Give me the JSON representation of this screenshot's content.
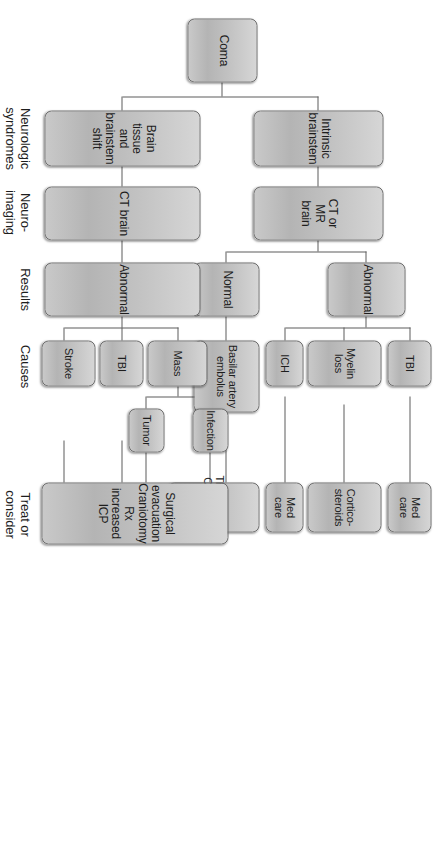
{
  "figure": {
    "orientation": "rotated-90",
    "box_fill": "#c3c3c3",
    "box_border": "#6d6d6d",
    "line_color": "#5d5d5d"
  },
  "row_labels": [
    {
      "id": "neurologic-syndromes",
      "text": "Neurologic\nsyndromes"
    },
    {
      "id": "neuro-imaging",
      "text": "Neuro-\nimaging"
    },
    {
      "id": "results",
      "text": "Results"
    },
    {
      "id": "causes",
      "text": "Causes"
    },
    {
      "id": "treat-or-consider",
      "text": "Treat or\nconsider"
    }
  ],
  "root": {
    "id": "coma",
    "text": "Coma"
  },
  "syndromes": [
    {
      "id": "brain-tissue-and-brainstem-shift",
      "text": "Brain tissue and\nbrainstem shift"
    },
    {
      "id": "intrinsic-brainstem",
      "text": "Intrinsic brainstem"
    }
  ],
  "imaging": [
    {
      "id": "ct-brain",
      "text": "CT brain"
    },
    {
      "id": "ct-or-mr-brain",
      "text": "CT or MR brain"
    }
  ],
  "results": [
    {
      "id": "results-abnormal-left",
      "text": "Abnormal"
    },
    {
      "id": "results-normal",
      "text": "Normal"
    },
    {
      "id": "results-abnormal-right",
      "text": "Abnormal"
    }
  ],
  "causes": [
    {
      "id": "cause-stroke",
      "text": "Stroke"
    },
    {
      "id": "cause-tbi-left",
      "text": "TBI"
    },
    {
      "id": "cause-mass",
      "text": "Mass"
    },
    {
      "id": "cause-tumor",
      "text": "Tumor"
    },
    {
      "id": "cause-infection",
      "text": "Infection"
    },
    {
      "id": "cause-basilar-artery-embolus",
      "text": "Basilar artery\nembolus"
    },
    {
      "id": "cause-ich",
      "text": "ICH"
    },
    {
      "id": "cause-myelin-loss",
      "text": "Myelin\nloss"
    },
    {
      "id": "cause-tbi-right",
      "text": "TBI"
    }
  ],
  "treatments": [
    {
      "id": "treatment-surgical",
      "text": "Surgical evacuation\nCraniotomy\nRx increased ICP"
    },
    {
      "id": "treatment-thrombolysis",
      "text": "Thrombolysis\nClot retrieval"
    },
    {
      "id": "treatment-med-care-ich",
      "text": "Med\ncare"
    },
    {
      "id": "treatment-corticosteroids",
      "text": "Cortico-\nsteroids"
    },
    {
      "id": "treatment-med-care-tbi",
      "text": "Med\ncare"
    }
  ]
}
